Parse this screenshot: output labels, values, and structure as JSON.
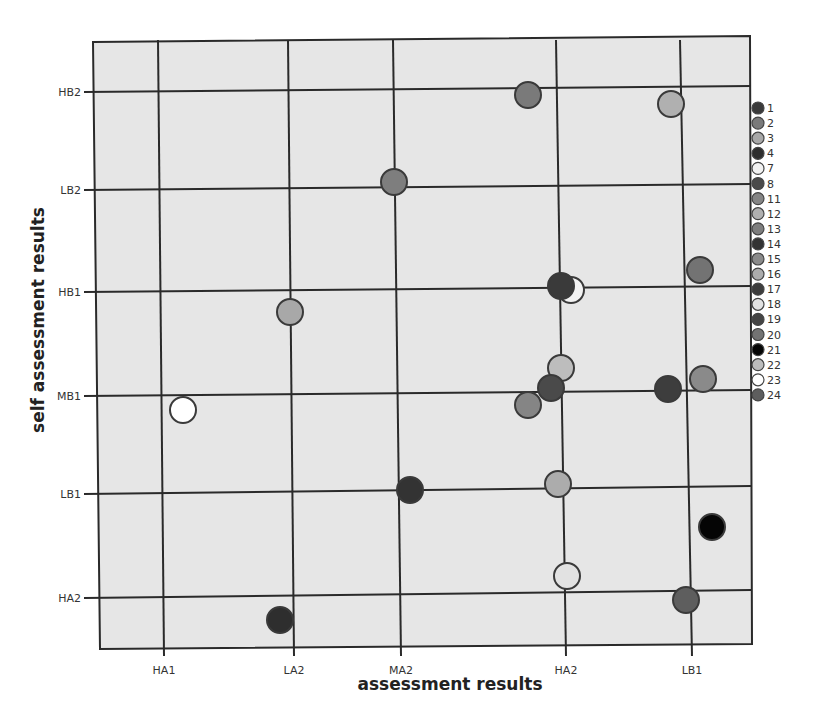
{
  "chart_data": {
    "type": "scatter",
    "title": "",
    "xlabel": "assessment results",
    "ylabel": "self assessment results",
    "x_categories": [
      "HA1",
      "LA2",
      "MA2",
      "HA2",
      "LB1"
    ],
    "y_categories": [
      "HA2",
      "LB1",
      "MB1",
      "HB1",
      "LB2",
      "HB2"
    ],
    "grid": true,
    "legend_position": "right",
    "legend": [
      {
        "id": "1",
        "color": "#3a3a3a"
      },
      {
        "id": "2",
        "color": "#7a7a7a"
      },
      {
        "id": "3",
        "color": "#a8a8a8"
      },
      {
        "id": "4",
        "color": "#2e2e2e"
      },
      {
        "id": "7",
        "color": "#f2f2f2"
      },
      {
        "id": "8",
        "color": "#4a4a4a"
      },
      {
        "id": "11",
        "color": "#858585"
      },
      {
        "id": "12",
        "color": "#b0b0b0"
      },
      {
        "id": "13",
        "color": "#7e7e7e"
      },
      {
        "id": "14",
        "color": "#333333"
      },
      {
        "id": "15",
        "color": "#8a8a8a"
      },
      {
        "id": "16",
        "color": "#acacac"
      },
      {
        "id": "17",
        "color": "#3d3d3d"
      },
      {
        "id": "18",
        "color": "#e2e2e2"
      },
      {
        "id": "19",
        "color": "#444444"
      },
      {
        "id": "20",
        "color": "#737373"
      },
      {
        "id": "21",
        "color": "#050505"
      },
      {
        "id": "22",
        "color": "#bdbdbd"
      },
      {
        "id": "23",
        "color": "#ffffff"
      },
      {
        "id": "24",
        "color": "#5e5e5e"
      }
    ],
    "points": [
      {
        "x": "HA2",
        "y": "HB2",
        "dx": -0.18,
        "dy": 0.03,
        "color": "#7a7a7a"
      },
      {
        "x": "LB1",
        "y": "HB2",
        "dx": -0.07,
        "dy": -0.12,
        "color": "#b0b0b0"
      },
      {
        "x": "MA2",
        "y": "LB2",
        "dx": 0.0,
        "dy": 0.08,
        "color": "#7e7e7e"
      },
      {
        "x": "LB1",
        "y": "HB1",
        "dx": 0.16,
        "dy": 0.2,
        "color": "#737373"
      },
      {
        "x": "HA2",
        "y": "HB1",
        "dx": 0.04,
        "dy": 0.0,
        "color": "#f2f2f2"
      },
      {
        "x": "HA2",
        "y": "HB1",
        "dx": 0.03,
        "dy": 0.05,
        "color": "#3a3a3a"
      },
      {
        "x": "LA2",
        "y": "HB1",
        "dx": 0.03,
        "dy": -0.2,
        "color": "#a8a8a8"
      },
      {
        "x": "HA2",
        "y": "MB1",
        "dx": 0.03,
        "dy": 0.28,
        "color": "#bdbdbd"
      },
      {
        "x": "HA2",
        "y": "MB1",
        "dx": -0.03,
        "dy": 0.08,
        "color": "#4a4a4a"
      },
      {
        "x": "HA2",
        "y": "MB1",
        "dx": -0.18,
        "dy": -0.12,
        "color": "#858585"
      },
      {
        "x": "LB1",
        "y": "MB1",
        "dx": -0.1,
        "dy": 0.05,
        "color": "#3d3d3d"
      },
      {
        "x": "LB1",
        "y": "MB1",
        "dx": 0.19,
        "dy": 0.16,
        "color": "#8a8a8a"
      },
      {
        "x": "HA1",
        "y": "MB1",
        "dx": 0.18,
        "dy": -0.15,
        "color": "#ffffff"
      },
      {
        "x": "MA2",
        "y": "LB1",
        "dx": 0.12,
        "dy": 0.05,
        "color": "#333333"
      },
      {
        "x": "HA2",
        "y": "LB1",
        "dx": 0.02,
        "dy": 0.12,
        "color": "#acacac"
      },
      {
        "x": "LB1",
        "y": "HA2",
        "dx": 0.26,
        "dy": 0.72,
        "color": "#050505"
      },
      {
        "x": "HA2",
        "y": "HA2",
        "dx": 0.08,
        "dy": 0.2,
        "color": "#e2e2e2"
      },
      {
        "x": "LB1",
        "y": "HA2",
        "dx": 0.05,
        "dy": -0.05,
        "color": "#5e5e5e"
      },
      {
        "x": "LA2",
        "y": "HA2",
        "dx": -0.07,
        "dy": -0.22,
        "color": "#2e2e2e"
      }
    ],
    "point_pixels": [
      {
        "cx": 528,
        "cy": 95,
        "fill": "#7a7a7a"
      },
      {
        "cx": 671,
        "cy": 104,
        "fill": "#b0b0b0"
      },
      {
        "cx": 394,
        "cy": 182,
        "fill": "#7e7e7e"
      },
      {
        "cx": 700,
        "cy": 270,
        "fill": "#737373"
      },
      {
        "cx": 571,
        "cy": 290,
        "fill": "#f2f2f2"
      },
      {
        "cx": 561,
        "cy": 286,
        "fill": "#3a3a3a"
      },
      {
        "cx": 290,
        "cy": 312,
        "fill": "#a8a8a8"
      },
      {
        "cx": 561,
        "cy": 368,
        "fill": "#bdbdbd"
      },
      {
        "cx": 551,
        "cy": 388,
        "fill": "#4a4a4a"
      },
      {
        "cx": 528,
        "cy": 405,
        "fill": "#858585"
      },
      {
        "cx": 668,
        "cy": 389,
        "fill": "#3d3d3d"
      },
      {
        "cx": 703,
        "cy": 379,
        "fill": "#8a8a8a"
      },
      {
        "cx": 183,
        "cy": 410,
        "fill": "#ffffff"
      },
      {
        "cx": 410,
        "cy": 490,
        "fill": "#333333"
      },
      {
        "cx": 558,
        "cy": 484,
        "fill": "#acacac"
      },
      {
        "cx": 712,
        "cy": 527,
        "fill": "#050505"
      },
      {
        "cx": 567,
        "cy": 576,
        "fill": "#e2e2e2"
      },
      {
        "cx": 686,
        "cy": 600,
        "fill": "#5e5e5e"
      },
      {
        "cx": 280,
        "cy": 620,
        "fill": "#2e2e2e"
      }
    ]
  },
  "colors": {
    "plot_background": "#e6e6e6",
    "grid_line": "#2a2a2a",
    "frame": "#2a2a2a",
    "point_stroke": "#3a3a3a"
  }
}
